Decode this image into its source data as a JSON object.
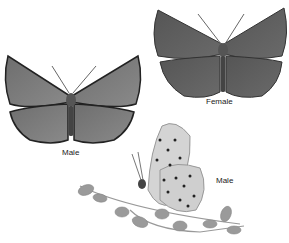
{
  "figure": {
    "labels": {
      "male_open": "Male",
      "female_open": "Female",
      "male_side": "Male"
    }
  }
}
